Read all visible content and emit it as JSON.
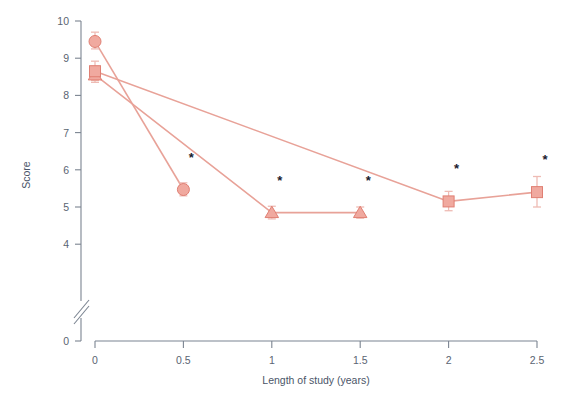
{
  "chart_data": {
    "type": "line",
    "title": "",
    "subtitle": "",
    "xlabel": "Length of study (years)",
    "ylabel": "Score",
    "xlim": [
      0,
      2.5
    ],
    "ylim": [
      3.7,
      10
    ],
    "y_axis_break": true,
    "y_break_label": "0",
    "grid": false,
    "legend_position": "none",
    "x_ticks": [
      0,
      0.5,
      1,
      1.5,
      2,
      2.5
    ],
    "x_tick_labels": [
      "0",
      "0.5",
      "1",
      "1.5",
      "2",
      "2.5"
    ],
    "y_ticks": [
      4,
      5,
      6,
      7,
      8,
      9,
      10
    ],
    "y_tick_labels": [
      "4",
      "5",
      "6",
      "7",
      "8",
      "9",
      "10"
    ],
    "accent_color": "#e8968c",
    "marker_fill": "#f0a99f",
    "marker_edge": "#e07f73",
    "line_color": "#e8a298",
    "errorbar_color": "#eebbb4",
    "star_symbol": "*",
    "series": [
      {
        "name": "Series 1",
        "marker": "circle",
        "x": [
          0,
          0.5
        ],
        "values": [
          9.45,
          5.47
        ],
        "err_low": [
          9.25,
          5.3
        ],
        "err_high": [
          9.7,
          5.65
        ],
        "stars": [
          false,
          true
        ]
      },
      {
        "name": "Series 2",
        "marker": "triangle",
        "x": [
          0,
          1,
          1.5
        ],
        "values": [
          8.55,
          4.85,
          4.85
        ],
        "err_low": [
          8.35,
          4.68,
          4.7
        ],
        "err_high": [
          8.78,
          5.02,
          5.0
        ],
        "stars": [
          false,
          true,
          true
        ]
      },
      {
        "name": "Series 3",
        "marker": "square",
        "x": [
          0,
          2,
          2.5
        ],
        "values": [
          8.65,
          5.15,
          5.4
        ],
        "err_low": [
          8.4,
          4.9,
          5.0
        ],
        "err_high": [
          8.92,
          5.42,
          5.82
        ],
        "stars": [
          false,
          true,
          true
        ]
      }
    ]
  },
  "axes": {
    "x_title": "Length of study (years)",
    "y_title": "Score",
    "break_tick_label": "0"
  }
}
